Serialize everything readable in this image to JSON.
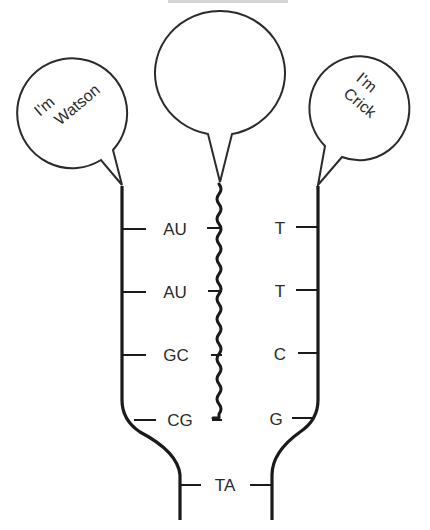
{
  "diagram": {
    "topic": "DNA-RNA hybrid between two DNA strands",
    "speech_bubbles": {
      "left": {
        "line1": "I'm",
        "line2": "Watson"
      },
      "middle": {
        "line1": "",
        "line2": ""
      },
      "right": {
        "line1": "I'm",
        "line2": "Crick"
      }
    },
    "left_pairs": [
      "AU",
      "AU",
      "GC",
      "CG"
    ],
    "right_bases": [
      "T",
      "T",
      "C",
      "G"
    ],
    "bottom_pair": "TA",
    "colors": {
      "line": "#1a1a1a",
      "text": "#2a2a2a",
      "background": "#ffffff"
    }
  }
}
